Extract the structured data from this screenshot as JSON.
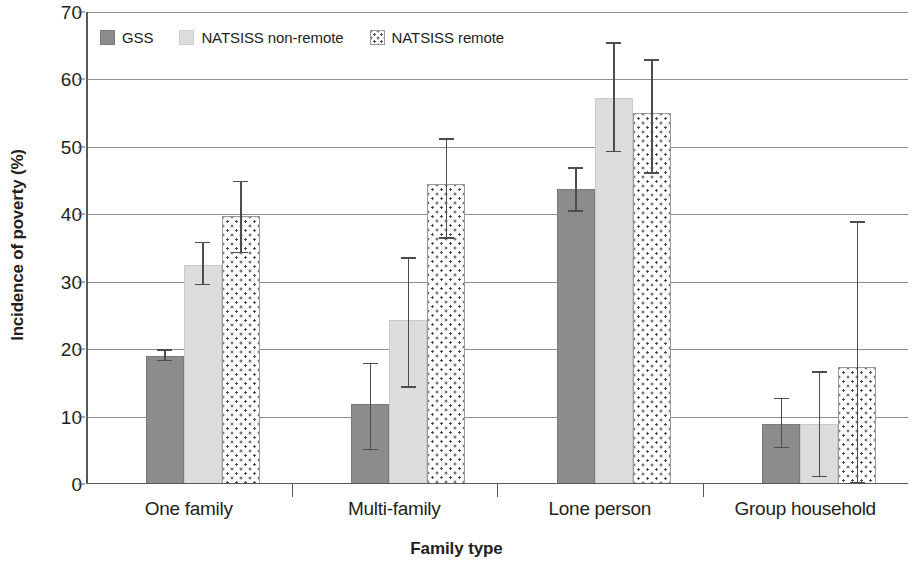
{
  "chart_data": {
    "type": "bar",
    "title": "",
    "xlabel": "Family type",
    "ylabel": "Incidence of poverty (%)",
    "categories": [
      "One family",
      "Multi-family",
      "Lone person",
      "Group household"
    ],
    "ylim": [
      0,
      70
    ],
    "ytick_values": [
      0,
      10,
      20,
      30,
      40,
      50,
      60,
      70
    ],
    "ytick_labels": [
      "0",
      "10",
      "20",
      "30",
      "40",
      "50",
      "60",
      "70"
    ],
    "grid": "horizontal",
    "legend_position": "top-left inside",
    "series": [
      {
        "name": "GSS",
        "color": "#8c8c8c",
        "pattern": "solid",
        "values": [
          19.0,
          11.8,
          43.8,
          8.9
        ],
        "error_low": [
          18.2,
          5.0,
          40.4,
          5.3
        ],
        "error_high": [
          20.0,
          18.0,
          47.0,
          12.8
        ]
      },
      {
        "name": "NATSISS non-remote",
        "color": "#dcdcdc",
        "pattern": "solid",
        "values": [
          32.5,
          24.3,
          57.2,
          8.9
        ],
        "error_low": [
          29.5,
          14.3,
          49.2,
          1.0
        ],
        "error_high": [
          35.9,
          33.6,
          65.5,
          16.7
        ]
      },
      {
        "name": "NATSISS remote",
        "color": "#ffffff",
        "pattern": "dotted",
        "values": [
          39.7,
          44.5,
          55.0,
          17.4
        ],
        "error_low": [
          34.2,
          36.4,
          46.0,
          0.0
        ],
        "error_high": [
          45.0,
          51.3,
          63.0,
          39.0
        ]
      }
    ]
  },
  "axis": {
    "y_title": "Incidence of poverty (%)",
    "x_title": "Family type"
  },
  "legend": {
    "items": [
      {
        "label": "GSS",
        "swatch": "legend-swatch-gss"
      },
      {
        "label": "NATSISS non-remote",
        "swatch": "legend-swatch-natsiss-non-remote"
      },
      {
        "label": "NATSISS remote",
        "swatch": "legend-swatch-natsiss-remote"
      }
    ]
  }
}
